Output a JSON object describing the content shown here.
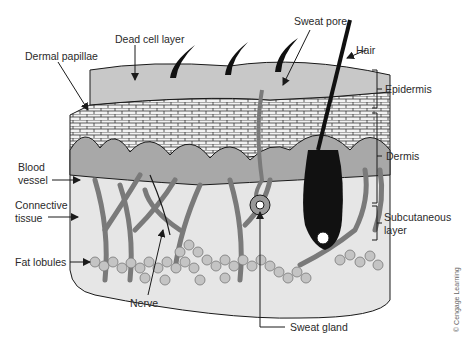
{
  "diagram": {
    "labels": {
      "dead_cell_layer": "Dead cell layer",
      "dermal_papillae": "Dermal papillae",
      "sweat_pore": "Sweat pore",
      "hair": "Hair",
      "epidermis": "Epidermis",
      "dermis": "Dermis",
      "subcutaneous_line1": "Subcutaneous",
      "subcutaneous_line2": "layer",
      "blood_vessel_line1": "Blood",
      "blood_vessel_line2": "vessel",
      "connective_tissue_line1": "Connective",
      "connective_tissue_line2": "tissue",
      "fat_lobules": "Fat lobules",
      "nerve": "Nerve",
      "sweat_gland": "Sweat gland"
    },
    "credit": "© Cengage Learning",
    "colors": {
      "outline": "#1a1a1a",
      "surface": "#c8c8c8",
      "dermis": "#e4e4e4",
      "vessel": "#7a7a7a",
      "fat": "#bdbdbd",
      "hair": "#111111"
    }
  }
}
